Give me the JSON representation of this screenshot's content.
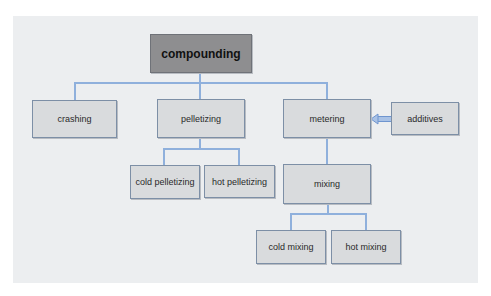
{
  "diagram": {
    "type": "hierarchy",
    "root": "compounding",
    "nodes": {
      "compounding": "compounding",
      "crashing": "crashing",
      "pelletizing": "pelletizing",
      "metering": "metering",
      "additives": "additives",
      "cold_pelletizing": "cold pelletizing",
      "hot_pelletizing": "hot pelletizing",
      "mixing": "mixing",
      "cold_mixing": "cold mixing",
      "hot_mixing": "hot mixing"
    },
    "edges": [
      {
        "from": "compounding",
        "to": "crashing"
      },
      {
        "from": "compounding",
        "to": "pelletizing"
      },
      {
        "from": "compounding",
        "to": "metering"
      },
      {
        "from": "additives",
        "to": "metering",
        "style": "arrow"
      },
      {
        "from": "pelletizing",
        "to": "cold pelletizing"
      },
      {
        "from": "pelletizing",
        "to": "hot pelletizing"
      },
      {
        "from": "metering",
        "to": "mixing"
      },
      {
        "from": "mixing",
        "to": "cold mixing"
      },
      {
        "from": "mixing",
        "to": "hot mixing"
      }
    ],
    "colors": {
      "panel_bg": "#eceef0",
      "root_fill": "#8e8e90",
      "node_fill": "#d9dbdd",
      "node_border": "#7d8fa6",
      "connector": "#8fb0dc"
    }
  }
}
